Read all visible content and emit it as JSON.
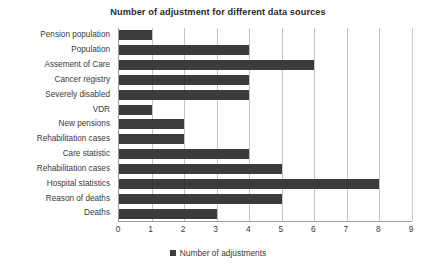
{
  "chart_data": {
    "type": "bar",
    "orientation": "horizontal",
    "title": "Number of adjustment for different data sources",
    "xlabel": "",
    "ylabel": "",
    "xlim": [
      0,
      9
    ],
    "xticks": [
      "0",
      "1",
      "2",
      "3",
      "4",
      "5",
      "6",
      "7",
      "8",
      "9"
    ],
    "grid": true,
    "legend_position": "bottom",
    "legend": [
      "Number of adjustments"
    ],
    "series_name": "Number of adjustments",
    "bar_color": "#3b3b3b",
    "gridline_color": "#c3c3c3",
    "axis_color": "#9d9d9d",
    "categories": [
      "Pension population",
      "Population",
      "Assement of Care",
      "Cancer registry",
      "Severely disabled",
      "VDR",
      "New pensions",
      "Rehabilitation cases",
      "Care statistic",
      "Rehabilitation cases",
      "Hospital statistics",
      "Reason of deaths",
      "Deaths"
    ],
    "values": [
      1,
      4,
      6,
      4,
      4,
      1,
      2,
      2,
      4,
      5,
      8,
      5,
      3
    ]
  }
}
